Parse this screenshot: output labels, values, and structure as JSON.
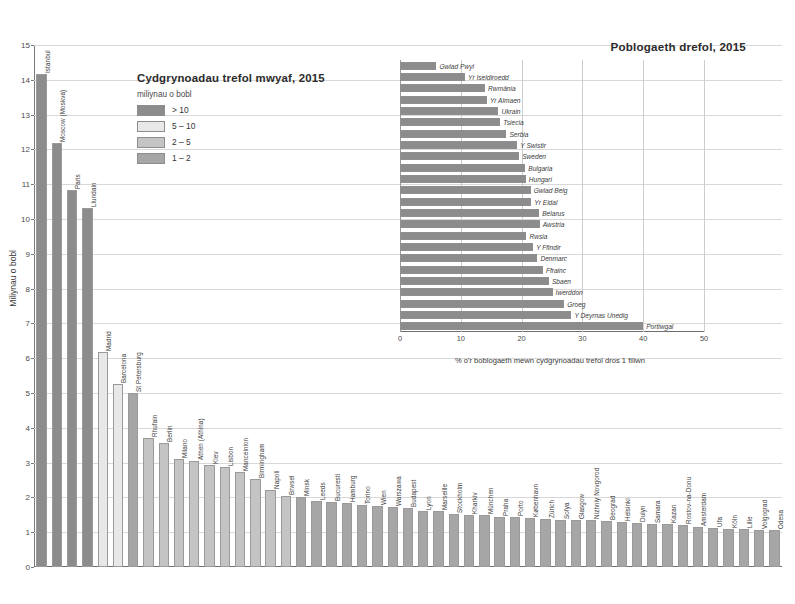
{
  "left": {
    "legend": {
      "title": "Cydgrynoadau trefol mwyaf, 2015",
      "subtitle": "miliynau o bobl",
      "items": [
        {
          "label": "> 10",
          "color": "#8c8c8c"
        },
        {
          "label": "5 – 10",
          "color": "#e8e8e8"
        },
        {
          "label": "2 – 5",
          "color": "#c4c4c4"
        },
        {
          "label": "1 – 2",
          "color": "#a6a6a6"
        }
      ]
    },
    "ylabel": "Miliynau o bobl",
    "yticks": [
      0,
      1,
      2,
      3,
      4,
      5,
      6,
      7,
      8,
      9,
      10,
      11,
      12,
      13,
      14,
      15
    ]
  },
  "right": {
    "title": "Poblogaeth drefol, 2015",
    "xlabel": "% o'r boblogaeth mewn cydgrynoadau trefol dros 1 filiwn",
    "xticks": [
      0,
      10,
      20,
      30,
      40,
      50
    ],
    "bar_color": "#8c8c8c"
  },
  "chart_data": [
    {
      "type": "bar",
      "title": "Cydgrynoadau trefol mwyaf, 2015",
      "xlabel": "",
      "ylabel": "Miliynau o bobl",
      "ylim": [
        0,
        15
      ],
      "grid": true,
      "legend_position": "inside-top-left",
      "categories": [
        "Istanbul",
        "Moscow (Moskva)",
        "Paris",
        "Llundain",
        "Madrid",
        "Barcelona",
        "St Petersburg",
        "Rhufain",
        "Berlin",
        "Milano",
        "Athen (Athina)",
        "Kiev",
        "Lisbon",
        "Manceinion",
        "Birmingham",
        "Napoli",
        "Brwsel",
        "Minsk",
        "Leeds",
        "Bucuresti",
        "Hamburg",
        "Torino",
        "Wien",
        "Warszawa",
        "Budapest",
        "Lyon",
        "Marseille",
        "Stockholm",
        "Kharkiv",
        "München",
        "Praha",
        "Porto",
        "København",
        "Zürich",
        "Sofya",
        "Glasgow",
        "Nizhniy Novgorod",
        "Beograd",
        "Helsinki",
        "Dulyn",
        "Samara",
        "Kazan",
        "Rostov-na-Donu",
        "Amsterdam",
        "Ufa",
        "Köln",
        "Lille",
        "Volgograd",
        "Odesa"
      ],
      "values": [
        14.16,
        12.17,
        10.84,
        10.31,
        6.17,
        5.26,
        4.99,
        3.72,
        3.56,
        3.1,
        3.05,
        2.92,
        2.88,
        2.73,
        2.54,
        2.2,
        2.05,
        2.0,
        1.9,
        1.88,
        1.84,
        1.77,
        1.75,
        1.72,
        1.71,
        1.61,
        1.6,
        1.51,
        1.5,
        1.49,
        1.44,
        1.43,
        1.4,
        1.38,
        1.36,
        1.35,
        1.34,
        1.33,
        1.28,
        1.27,
        1.25,
        1.23,
        1.2,
        1.16,
        1.12,
        1.1,
        1.09,
        1.07,
        1.05
      ],
      "bar_colors": [
        "#8c8c8c",
        "#8c8c8c",
        "#8c8c8c",
        "#8c8c8c",
        "#e8e8e8",
        "#e8e8e8",
        "#a6a6a6",
        "#c4c4c4",
        "#c4c4c4",
        "#c4c4c4",
        "#c4c4c4",
        "#c4c4c4",
        "#c4c4c4",
        "#c4c4c4",
        "#c4c4c4",
        "#c4c4c4",
        "#c4c4c4",
        "#a6a6a6",
        "#a6a6a6",
        "#a6a6a6",
        "#a6a6a6",
        "#a6a6a6",
        "#a6a6a6",
        "#a6a6a6",
        "#a6a6a6",
        "#a6a6a6",
        "#a6a6a6",
        "#a6a6a6",
        "#a6a6a6",
        "#a6a6a6",
        "#a6a6a6",
        "#a6a6a6",
        "#a6a6a6",
        "#a6a6a6",
        "#a6a6a6",
        "#a6a6a6",
        "#a6a6a6",
        "#a6a6a6",
        "#a6a6a6",
        "#a6a6a6",
        "#a6a6a6",
        "#a6a6a6",
        "#a6a6a6",
        "#a6a6a6",
        "#a6a6a6",
        "#a6a6a6",
        "#a6a6a6",
        "#a6a6a6",
        "#a6a6a6"
      ]
    },
    {
      "type": "bar",
      "orientation": "horizontal",
      "title": "Poblogaeth drefol, 2015",
      "xlabel": "% o'r boblogaeth mewn cydgrynoadau trefol dros 1 filiwn",
      "ylabel": "",
      "xlim": [
        0,
        50
      ],
      "grid": true,
      "categories": [
        "Gwlad Pwyl",
        "Yr Iseldiroedd",
        "Rwmânia",
        "Yr Almaen",
        "Ukrain",
        "Tsiecia",
        "Serbia",
        "Y Swistir",
        "Sweden",
        "Bulgaria",
        "Hungari",
        "Gwlad Belg",
        "Yr Eidal",
        "Belarus",
        "Awstria",
        "Rwsia",
        "Y Ffindir",
        "Denmarc",
        "Ffrainc",
        "Sbaen",
        "Iwerddon",
        "Groeg",
        "Y Deyrnas Unedig",
        "Portiwgal"
      ],
      "values": [
        6.0,
        10.7,
        14.0,
        14.3,
        16.2,
        16.5,
        17.5,
        19.3,
        19.6,
        20.6,
        20.7,
        21.5,
        21.6,
        22.9,
        23.0,
        20.8,
        21.9,
        22.6,
        23.5,
        24.5,
        25.1,
        27.0,
        28.2,
        40.0
      ]
    }
  ]
}
